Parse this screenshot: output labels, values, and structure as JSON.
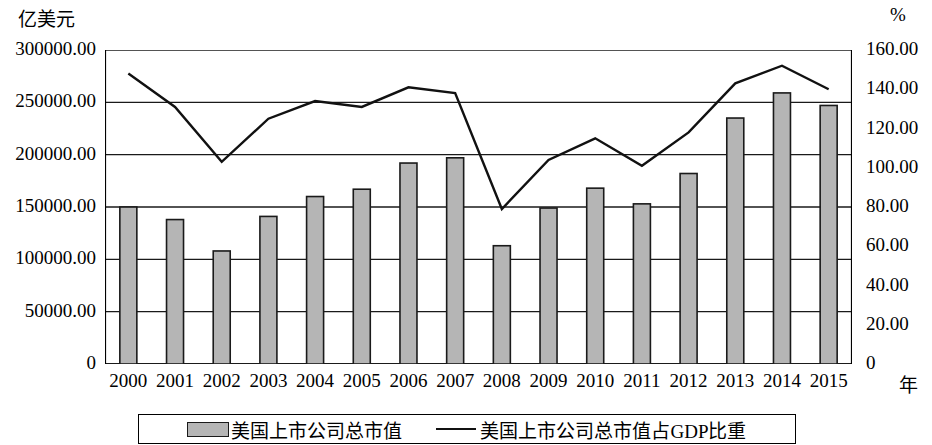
{
  "axes": {
    "left_unit": "亿美元",
    "right_unit": "%",
    "x_unit": "年",
    "left_ticks": [
      "300000.00",
      "250000.00",
      "200000.00",
      "150000.00",
      "100000.00",
      "50000.00",
      "0"
    ],
    "right_ticks": [
      "160.00",
      "140.00",
      "120.00",
      "100.00",
      "80.00",
      "60.00",
      "40.00",
      "20.00",
      "0"
    ]
  },
  "legend": {
    "bar_label": "美国上市公司总市值",
    "line_label": "美国上市公司总市值占GDP比重"
  },
  "colors": {
    "bar_fill": "#b5b5b5",
    "bar_stroke": "#1a1a1a",
    "line": "#111111",
    "grid": "#1a1a1a",
    "axis": "#000000"
  },
  "chart_data": {
    "type": "bar",
    "title": "",
    "xlabel": "年",
    "ylabel": "亿美元",
    "y2label": "%",
    "ylim": [
      0,
      300000
    ],
    "y2lim": [
      0,
      160
    ],
    "grid": true,
    "legend_position": "bottom",
    "categories": [
      "2000",
      "2001",
      "2002",
      "2003",
      "2004",
      "2005",
      "2006",
      "2007",
      "2008",
      "2009",
      "2010",
      "2011",
      "2012",
      "2013",
      "2014",
      "2015"
    ],
    "series": [
      {
        "name": "美国上市公司总市值",
        "type": "bar",
        "axis": "left",
        "unit": "亿美元",
        "values": [
          150000,
          138000,
          108000,
          141000,
          160000,
          167000,
          192000,
          197000,
          113000,
          149000,
          168000,
          153000,
          182000,
          235000,
          259000,
          247000
        ]
      },
      {
        "name": "美国上市公司总市值占GDP比重",
        "type": "line",
        "axis": "right",
        "unit": "%",
        "values": [
          148.0,
          131.0,
          103.0,
          125.0,
          134.0,
          131.0,
          141.0,
          138.0,
          79.0,
          104.0,
          115.0,
          101.0,
          118.0,
          143.0,
          152.0,
          140.0
        ]
      }
    ]
  }
}
